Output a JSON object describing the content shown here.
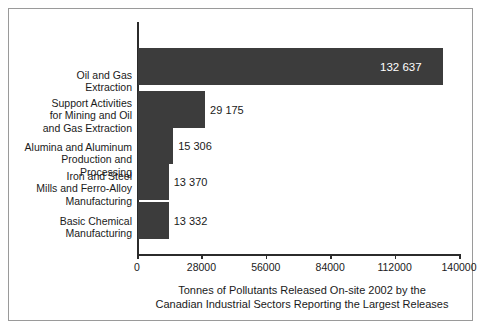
{
  "chart_data": {
    "type": "bar",
    "orientation": "horizontal",
    "title": "",
    "caption_lines": [
      "Tonnes of Pollutants Released On-site 2002 by the",
      "Canadian Industrial Sectors Reporting the Largest Releases"
    ],
    "xlabel": "",
    "ylabel": "",
    "xlim": [
      0,
      140000
    ],
    "grid": false,
    "legend": null,
    "bar_color": "#3c3c3c",
    "categories": [
      "Oil and Gas\nExtraction",
      "Support Activities\nfor Mining and Oil\nand Gas Extraction",
      "Alumina and Aluminum\nProduction and Processing",
      "Iron and Steel\nMills and Ferro-Alloy\nManufacturing",
      "Basic Chemical\nManufacturing"
    ],
    "category_lines": [
      [
        "Oil and Gas",
        "Extraction"
      ],
      [
        "Support Activities",
        "for Mining and Oil",
        "and Gas Extraction"
      ],
      [
        "Alumina and Aluminum",
        "Production and Processing"
      ],
      [
        "Iron and Steel",
        "Mills and Ferro-Alloy",
        "Manufacturing"
      ],
      [
        "Basic Chemical",
        "Manufacturing"
      ]
    ],
    "values": [
      132637,
      29175,
      15306,
      13370,
      13332
    ],
    "value_labels": [
      "132 637",
      "29 175",
      "15 306",
      "13 370",
      "13 332"
    ],
    "value_label_placement": [
      "inside",
      "outside",
      "outside",
      "outside",
      "outside"
    ],
    "xticks": [
      0,
      28000,
      56000,
      84000,
      112000,
      140000
    ],
    "xtick_labels": [
      "0",
      "28000",
      "56000",
      "84000",
      "112000",
      "140000"
    ]
  }
}
